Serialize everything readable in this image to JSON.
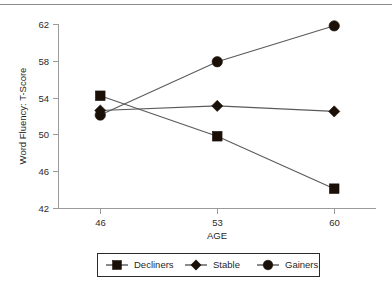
{
  "chart_data": {
    "type": "line",
    "title": "",
    "xlabel": "AGE",
    "ylabel": "Word Fluency: T-Score",
    "categories": [
      "46",
      "53",
      "60"
    ],
    "x": [
      46,
      53,
      60
    ],
    "xlim": [
      43.5,
      62.5
    ],
    "ylim": [
      42,
      62
    ],
    "yticks": [
      "42",
      "46",
      "50",
      "54",
      "58",
      "62"
    ],
    "ytick_values": [
      42,
      46,
      50,
      54,
      58,
      62
    ],
    "xticks": [
      "46",
      "53",
      "60"
    ],
    "grid": false,
    "legend_position": "bottom",
    "series": [
      {
        "name": "Decliners",
        "marker": "square",
        "color": "#1a1008",
        "values": [
          54.2,
          49.8,
          44.1
        ]
      },
      {
        "name": "Stable",
        "marker": "diamond",
        "color": "#1a1008",
        "values": [
          52.6,
          53.1,
          52.5
        ]
      },
      {
        "name": "Gainers",
        "marker": "circle",
        "color": "#1a1008",
        "values": [
          52.1,
          57.9,
          61.8
        ]
      }
    ]
  },
  "legend": {
    "items": [
      {
        "label": "Decliners",
        "marker": "square"
      },
      {
        "label": "Stable",
        "marker": "diamond"
      },
      {
        "label": "Gainers",
        "marker": "circle"
      }
    ]
  },
  "colors": {
    "marker": "#1a1008",
    "line": "#5a5a5a",
    "axis": "#9a9a9a",
    "text": "#1f1f1f",
    "legend_border": "#2b2b2b",
    "top_rule": "#8a8a8a",
    "background": "#ffffff"
  }
}
